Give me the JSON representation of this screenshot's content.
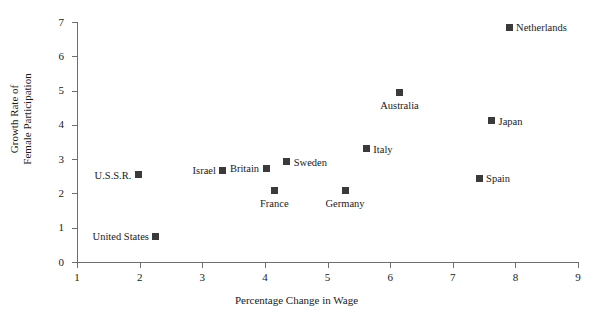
{
  "chart_data": {
    "type": "scatter",
    "title": "",
    "xlabel": "Percentage Change in Wage",
    "ylabel_line1": "Growth Rate of",
    "ylabel_line2": "Female Participation",
    "xlim": [
      1,
      9
    ],
    "ylim": [
      0,
      7
    ],
    "xticks": [
      1,
      2,
      3,
      4,
      5,
      6,
      7,
      8,
      9
    ],
    "yticks": [
      0,
      1,
      2,
      3,
      4,
      5,
      6,
      7
    ],
    "grid": false,
    "legend": "none",
    "marker": "filled-square",
    "marker_color": "#3a3a3a",
    "points": [
      {
        "label": "United States",
        "x": 2.26,
        "y": 0.75,
        "label_pos": "left"
      },
      {
        "label": "U.S.S.R.",
        "x": 1.98,
        "y": 2.55,
        "label_pos": "left"
      },
      {
        "label": "Israel",
        "x": 3.33,
        "y": 2.68,
        "label_pos": "left"
      },
      {
        "label": "Britain",
        "x": 4.02,
        "y": 2.73,
        "label_pos": "left"
      },
      {
        "label": "Sweden",
        "x": 4.35,
        "y": 2.92,
        "label_pos": "right"
      },
      {
        "label": "France",
        "x": 4.15,
        "y": 2.08,
        "label_pos": "below"
      },
      {
        "label": "Germany",
        "x": 5.28,
        "y": 2.08,
        "label_pos": "below"
      },
      {
        "label": "Italy",
        "x": 5.62,
        "y": 3.3,
        "label_pos": "right"
      },
      {
        "label": "Australia",
        "x": 6.15,
        "y": 4.93,
        "label_pos": "below"
      },
      {
        "label": "Japan",
        "x": 7.62,
        "y": 4.12,
        "label_pos": "right"
      },
      {
        "label": "Spain",
        "x": 7.42,
        "y": 2.45,
        "label_pos": "right"
      },
      {
        "label": "Netherlands",
        "x": 7.9,
        "y": 6.85,
        "label_pos": "right"
      }
    ]
  }
}
